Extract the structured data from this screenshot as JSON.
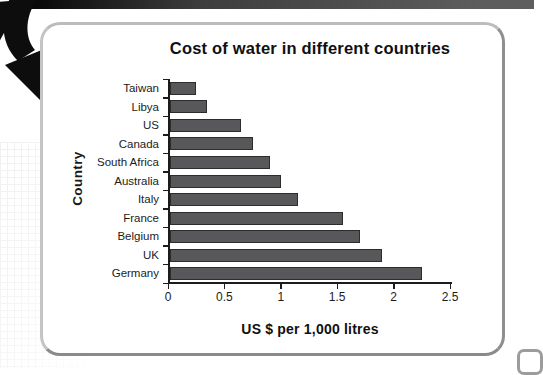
{
  "decorations": {
    "arrow_icon": "curved-black-arrow",
    "page_edge_color": "#2e2e2e",
    "card_border_color": "#9c9c9c"
  },
  "chart_data": {
    "type": "bar",
    "orientation": "horizontal",
    "title": "Cost of water in different countries",
    "xlabel": "US $ per 1,000 litres",
    "ylabel": "Country",
    "categories": [
      "Taiwan",
      "Libya",
      "US",
      "Canada",
      "South Africa",
      "Australia",
      "Italy",
      "France",
      "Belgium",
      "UK",
      "Germany"
    ],
    "values": [
      0.25,
      0.35,
      0.65,
      0.75,
      0.9,
      1.0,
      1.15,
      1.55,
      1.7,
      1.9,
      2.25
    ],
    "xlim": [
      0,
      2.5
    ],
    "xticks": [
      "0",
      "0.5",
      "1",
      "1.5",
      "2",
      "2.5"
    ],
    "xtick_values": [
      0,
      0.5,
      1,
      1.5,
      2,
      2.5
    ],
    "grid": false,
    "legend": "none",
    "bar_color": "#58585a",
    "bar_border_color": "#2c2c2c",
    "axis_color": "#1c1c1c"
  }
}
